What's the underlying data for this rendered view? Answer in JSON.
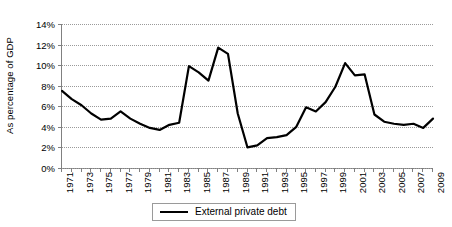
{
  "chart_data": {
    "type": "line",
    "title": "",
    "xlabel": "",
    "ylabel": "As percentage of GDP",
    "ylim": [
      0,
      14
    ],
    "ytick_labels": [
      "0%",
      "2%",
      "4%",
      "6%",
      "8%",
      "10%",
      "12%",
      "14%"
    ],
    "ytick_values": [
      0,
      2,
      4,
      6,
      8,
      10,
      12,
      14
    ],
    "grid": "horizontal-dotted",
    "legend_position": "bottom-center",
    "legend_entries": [
      "External private debt"
    ],
    "xlim": [
      1971,
      2009
    ],
    "x": [
      1971,
      1972,
      1973,
      1974,
      1975,
      1976,
      1977,
      1978,
      1979,
      1980,
      1981,
      1982,
      1983,
      1984,
      1985,
      1986,
      1987,
      1988,
      1989,
      1990,
      1991,
      1992,
      1993,
      1994,
      1995,
      1996,
      1997,
      1998,
      1999,
      2000,
      2001,
      2002,
      2003,
      2004,
      2005,
      2006,
      2007,
      2008,
      2009
    ],
    "xtick_labels": [
      "1971",
      "",
      "1973",
      "",
      "1975",
      "",
      "1977",
      "",
      "1979",
      "",
      "1981",
      "",
      "1983",
      "",
      "1985",
      "",
      "1987",
      "",
      "1989",
      "",
      "1991",
      "",
      "1993",
      "",
      "1995",
      "",
      "1997",
      "",
      "1999",
      "",
      "2001",
      "",
      "2003",
      "",
      "2005",
      "",
      "2007",
      "",
      "2009"
    ],
    "series": [
      {
        "name": "External private debt",
        "color": "#000000",
        "values": [
          7.5,
          6.7,
          6.1,
          5.3,
          4.7,
          4.8,
          5.5,
          4.8,
          4.3,
          3.9,
          3.7,
          4.2,
          4.4,
          9.9,
          9.3,
          8.5,
          11.7,
          11.1,
          5.3,
          2.0,
          2.2,
          2.9,
          3.0,
          3.2,
          4.0,
          5.9,
          5.5,
          6.4,
          7.9,
          10.2,
          9.0,
          9.1,
          5.2,
          4.5,
          4.3,
          4.2,
          4.3,
          3.9,
          4.8
        ]
      }
    ]
  },
  "legend": {
    "label": "External private debt"
  }
}
